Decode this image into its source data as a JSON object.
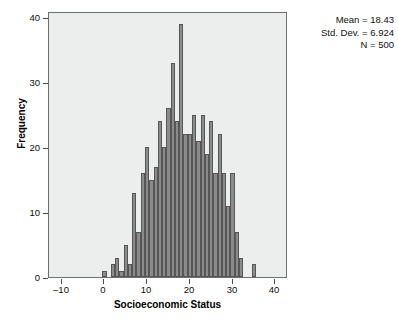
{
  "chart_data": {
    "type": "bar",
    "title": "",
    "subtitle": "",
    "xlabel": "Socioeconomic Status",
    "ylabel": "Frequency",
    "xlim": [
      -13,
      43
    ],
    "ylim": [
      0,
      41
    ],
    "xticks": [
      -10,
      0,
      10,
      20,
      30,
      40
    ],
    "xtick_labels": [
      "–10",
      "0",
      "10",
      "20",
      "30",
      "40"
    ],
    "yticks": [
      0,
      10,
      20,
      30,
      40
    ],
    "ytick_labels": [
      "0",
      "10",
      "20",
      "30",
      "40"
    ],
    "grid": false,
    "legend": null,
    "bar_color": "#8b8b8b",
    "bar_edge_color": "#565656",
    "plot_background": "#eceded",
    "bin_width": 1,
    "x": [
      0,
      1,
      2,
      3,
      4,
      5,
      6,
      7,
      8,
      9,
      10,
      11,
      12,
      13,
      14,
      15,
      16,
      17,
      18,
      19,
      20,
      21,
      22,
      23,
      24,
      25,
      26,
      27,
      28,
      29,
      30,
      31,
      32,
      35
    ],
    "values": [
      1,
      0,
      2,
      3,
      1,
      5,
      2,
      13,
      7,
      16,
      20,
      15,
      17,
      24,
      20,
      26,
      33,
      24,
      39,
      22,
      22,
      25,
      21,
      25,
      19,
      24,
      16,
      22,
      16,
      11,
      16,
      7,
      3,
      2
    ],
    "annotations": {
      "mean_label": "Mean = 18.43",
      "std_dev_label": "Std. Dev. = 6.924",
      "n_label": "N = 500"
    }
  },
  "stats": {
    "mean": "Mean = 18.43",
    "std_dev": "Std. Dev. = 6.924",
    "n": "N = 500"
  },
  "axes": {
    "x_title": "Socioeconomic Status",
    "y_title": "Frequency"
  }
}
